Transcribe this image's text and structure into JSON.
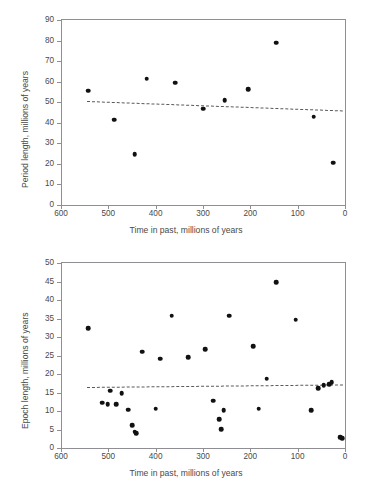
{
  "figure": {
    "background": "#ffffff",
    "point_color": "#111111",
    "axis_color": "#8e8e93",
    "trend_color": "#5a5a5a"
  },
  "chart_data": [
    {
      "type": "scatter",
      "id": "period-length",
      "title": "",
      "xlabel": "Time in past, millions of years",
      "ylabel": "Period length, millions of years",
      "xlim": [
        600,
        0
      ],
      "ylim": [
        0,
        90
      ],
      "x_reversed": true,
      "grid": false,
      "legend": null,
      "xticks": [
        600,
        500,
        400,
        300,
        200,
        100,
        0
      ],
      "yticks": [
        0,
        10,
        20,
        30,
        40,
        50,
        60,
        70,
        80,
        90
      ],
      "points": [
        {
          "x": 542,
          "y": 55.6
        },
        {
          "x": 488,
          "y": 41.5
        },
        {
          "x": 444,
          "y": 24.8
        },
        {
          "x": 419,
          "y": 61.5
        },
        {
          "x": 359,
          "y": 59.4
        },
        {
          "x": 299,
          "y": 46.8
        },
        {
          "x": 254,
          "y": 51.0
        },
        {
          "x": 205,
          "y": 56.4
        },
        {
          "x": 145,
          "y": 79.0
        },
        {
          "x": 66,
          "y": 43.0
        },
        {
          "x": 25,
          "y": 20.5
        }
      ],
      "trendline": {
        "style": "dashed",
        "x_start": 545,
        "y_start": 50.8,
        "x_end": 5,
        "y_end": 46.2
      }
    },
    {
      "type": "scatter",
      "id": "epoch-length",
      "title": "",
      "xlabel": "Time in past, millions of years",
      "ylabel": "Epoch length, millions of years",
      "xlim": [
        600,
        0
      ],
      "ylim": [
        0,
        50
      ],
      "x_reversed": true,
      "grid": false,
      "legend": null,
      "xticks": [
        600,
        500,
        400,
        300,
        200,
        100,
        0
      ],
      "yticks": [
        0,
        5,
        10,
        15,
        20,
        25,
        30,
        35,
        40,
        45,
        50
      ],
      "points": [
        {
          "x": 542,
          "y": 32.3
        },
        {
          "x": 513,
          "y": 12.2
        },
        {
          "x": 501,
          "y": 11.9
        },
        {
          "x": 496,
          "y": 15.5
        },
        {
          "x": 483,
          "y": 11.9
        },
        {
          "x": 472,
          "y": 14.8
        },
        {
          "x": 458,
          "y": 10.4
        },
        {
          "x": 450,
          "y": 6.1
        },
        {
          "x": 444,
          "y": 4.4
        },
        {
          "x": 441,
          "y": 4.0
        },
        {
          "x": 428,
          "y": 26.0
        },
        {
          "x": 400,
          "y": 10.6
        },
        {
          "x": 391,
          "y": 24.1
        },
        {
          "x": 366,
          "y": 35.8
        },
        {
          "x": 331,
          "y": 24.5
        },
        {
          "x": 295,
          "y": 26.7
        },
        {
          "x": 279,
          "y": 12.8
        },
        {
          "x": 266,
          "y": 7.8
        },
        {
          "x": 261,
          "y": 5.1
        },
        {
          "x": 256,
          "y": 10.2
        },
        {
          "x": 245,
          "y": 35.8
        },
        {
          "x": 194,
          "y": 27.5
        },
        {
          "x": 182,
          "y": 10.6
        },
        {
          "x": 165,
          "y": 18.7
        },
        {
          "x": 145,
          "y": 44.8
        },
        {
          "x": 104,
          "y": 34.7
        },
        {
          "x": 72,
          "y": 10.2
        },
        {
          "x": 57,
          "y": 16.2
        },
        {
          "x": 45,
          "y": 17.0
        },
        {
          "x": 33,
          "y": 17.2
        },
        {
          "x": 28,
          "y": 17.8
        },
        {
          "x": 10,
          "y": 2.9
        },
        {
          "x": 6,
          "y": 2.6
        }
      ],
      "trendline": {
        "style": "dashed",
        "x_start": 545,
        "y_start": 16.6,
        "x_end": 5,
        "y_end": 17.3
      }
    }
  ]
}
